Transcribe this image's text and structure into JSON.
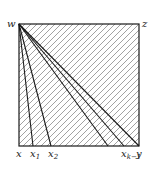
{
  "diagram": {
    "square": {
      "x": 19,
      "y": 24,
      "size": 120
    },
    "colors": {
      "stroke": "#1a1a1a",
      "hatch": "#8a8a8a",
      "background": "#ffffff"
    },
    "hatch_spacing": 6,
    "apex": "w",
    "vertices": {
      "top_left": "w",
      "top_right": "z",
      "bottom_left": "x",
      "bottom_right": "y"
    },
    "fan_lines_bottom_x": [
      33,
      51,
      108,
      124,
      139
    ],
    "bottom_labels": [
      {
        "id": "x",
        "base": "x",
        "sub": "",
        "x": 19
      },
      {
        "id": "x1",
        "base": "x",
        "sub": "1",
        "x": 33
      },
      {
        "id": "x2",
        "base": "x",
        "sub": "2",
        "x": 51
      },
      {
        "id": "xk-1",
        "base": "x",
        "sub": "k−1",
        "x": 124
      },
      {
        "id": "y",
        "base": "y",
        "sub": "",
        "x": 139
      }
    ],
    "labels": {
      "w": "w",
      "z": "z"
    }
  }
}
